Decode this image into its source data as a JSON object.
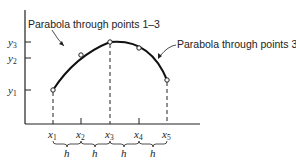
{
  "diagram": {
    "annotations": {
      "left": "Parabola through points 1–3",
      "right": "Parabola through points 3–5"
    },
    "x_labels": [
      {
        "base": "x",
        "sub": "1"
      },
      {
        "base": "x",
        "sub": "2"
      },
      {
        "base": "x",
        "sub": "3"
      },
      {
        "base": "x",
        "sub": "4"
      },
      {
        "base": "x",
        "sub": "5"
      }
    ],
    "y_labels": [
      {
        "base": "y",
        "sub": "3"
      },
      {
        "base": "y",
        "sub": "2"
      },
      {
        "base": "y",
        "sub": "1"
      }
    ],
    "spacing_label": "h",
    "spacing_count": 4,
    "colors": {
      "line": "#111111",
      "text": "#222222"
    }
  }
}
